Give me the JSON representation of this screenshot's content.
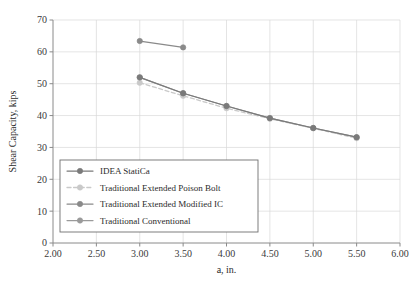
{
  "chart_data": {
    "type": "line",
    "title": "",
    "xlabel": "a, in.",
    "ylabel": "Shear Capacity, kips",
    "xlim": [
      2.0,
      6.0
    ],
    "ylim": [
      0,
      70
    ],
    "xticks": [
      "2.00",
      "2.50",
      "3.00",
      "3.50",
      "4.00",
      "4.50",
      "5.00",
      "5.50",
      "6.00"
    ],
    "xtick_values": [
      2.0,
      2.5,
      3.0,
      3.5,
      4.0,
      4.5,
      5.0,
      5.5,
      6.0
    ],
    "yticks": [
      "0",
      "10",
      "20",
      "30",
      "40",
      "50",
      "60",
      "70"
    ],
    "ytick_values": [
      0,
      10,
      20,
      30,
      40,
      50,
      60,
      70
    ],
    "grid": true,
    "legend_position": "lower left",
    "series": [
      {
        "name": "IDEA StatiCa",
        "color": "#7a7a7a",
        "linestyle": "solid",
        "marker": "circle",
        "x": [
          3.0,
          3.5,
          4.0,
          4.5,
          5.0,
          5.5
        ],
        "values": [
          52.0,
          47.0,
          43.0,
          39.2,
          36.1,
          33.2
        ]
      },
      {
        "name": "Traditional Extended Poison Bolt",
        "color": "#c9c9c9",
        "linestyle": "dashed",
        "marker": "circle",
        "x": [
          3.0,
          3.5,
          4.0,
          4.5,
          5.0,
          5.5
        ],
        "values": [
          50.3,
          46.2,
          42.3,
          39.0,
          36.0,
          32.9
        ]
      },
      {
        "name": "Traditional Extended Modified IC",
        "color": "#8a8a8a",
        "linestyle": "solid",
        "marker": "circle",
        "x": [
          3.0,
          3.5
        ],
        "values": [
          63.4,
          61.4
        ]
      },
      {
        "name": "Traditional Conventional",
        "color": "#9a9a9a",
        "linestyle": "solid",
        "marker": "circle",
        "x": [
          3.0,
          3.5,
          4.0,
          4.5,
          5.0,
          5.5
        ],
        "values": [
          52.0,
          47.0,
          43.0,
          39.2,
          36.1,
          33.2
        ]
      }
    ]
  }
}
